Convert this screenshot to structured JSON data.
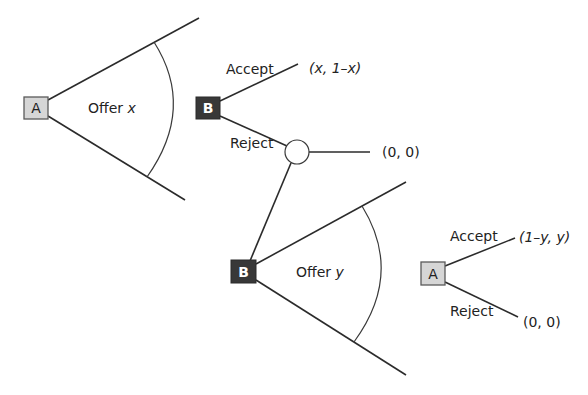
{
  "diagram": {
    "type": "extensive-form game tree (two-stage ultimatum / alternating-offer bargaining)",
    "nodes": {
      "root_a": {
        "player": "A",
        "style": "light-grey box"
      },
      "b1": {
        "player": "B",
        "style": "dark box"
      },
      "chance": {
        "player": "",
        "style": "open circle"
      },
      "b2": {
        "player": "B",
        "style": "dark box"
      },
      "a2": {
        "player": "A",
        "style": "light-grey box"
      }
    },
    "labels": {
      "offer_x_word": "Offer",
      "offer_x_var": "x",
      "accept1": "Accept",
      "reject1": "Reject",
      "payoff_accept1": "(x, 1–x)",
      "payoff_chance": "(0, 0)",
      "offer_y_word": "Offer",
      "offer_y_var": "y",
      "accept2": "Accept",
      "reject2": "Reject",
      "payoff_accept2": "(1–y, y)",
      "payoff_reject2": "(0, 0)"
    },
    "colors": {
      "player_a_fill": "#d6d6d6",
      "player_b_fill": "#383838",
      "line": "#2b2b2b"
    }
  }
}
